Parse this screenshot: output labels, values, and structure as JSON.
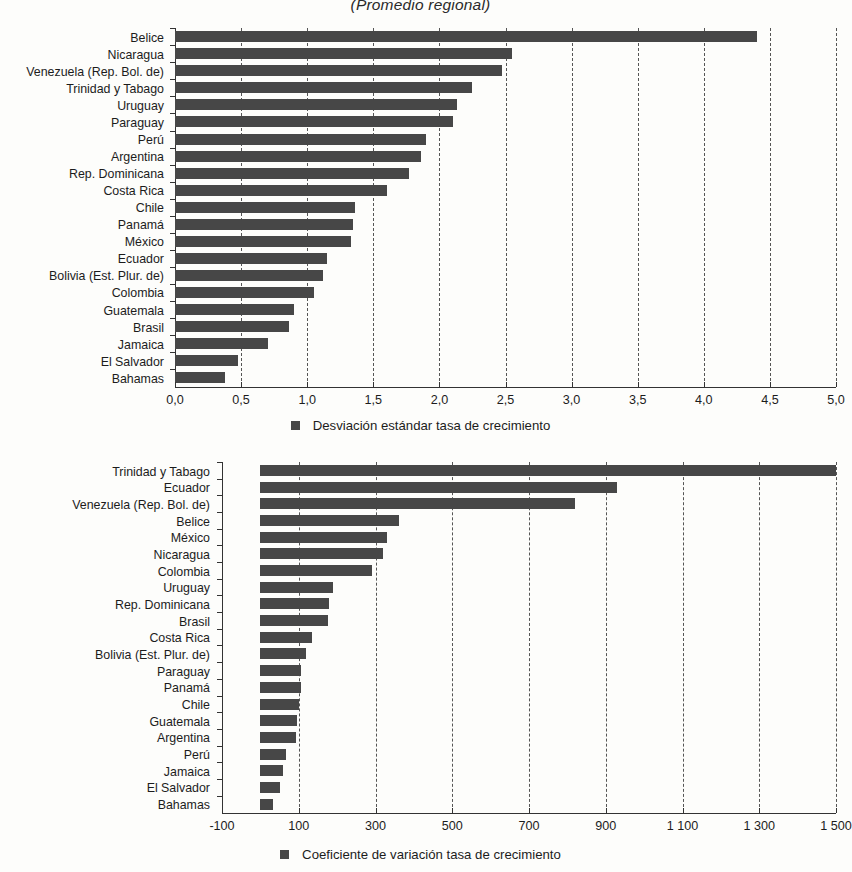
{
  "title": "(Promedio regional)",
  "colors": {
    "bar": "#474747",
    "axis": "#333333",
    "text": "#1c1c1c"
  },
  "charts": [
    {
      "legend_label": "Desviación estándar tasa de crecimiento",
      "legend_icon": "square-marker-icon"
    },
    {
      "legend_label": "Coeficiente de variación tasa de crecimiento",
      "legend_icon": "square-marker-icon"
    }
  ],
  "chart_data": [
    {
      "type": "bar",
      "orientation": "horizontal",
      "title": "(Promedio regional)",
      "xlabel": "",
      "ylabel": "",
      "xlim": [
        0,
        5
      ],
      "xticks": [
        0,
        0.5,
        1,
        1.5,
        2,
        2.5,
        3,
        3.5,
        4,
        4.5,
        5
      ],
      "xticklabels": [
        "0,0",
        "0,5",
        "1,0",
        "1,5",
        "2,0",
        "2,5",
        "3,0",
        "3,5",
        "4,0",
        "4,5",
        "5,0"
      ],
      "grid": true,
      "legend": [
        "Desviación estándar tasa de crecimiento"
      ],
      "legend_position": "bottom",
      "categories": [
        "Belice",
        "Nicaragua",
        "Venezuela (Rep. Bol. de)",
        "Trinidad y Tabago",
        "Uruguay",
        "Paraguay",
        "Perú",
        "Argentina",
        "Rep. Dominicana",
        "Costa Rica",
        "Chile",
        "Panamá",
        "México",
        "Ecuador",
        "Bolivia (Est. Plur. de)",
        "Colombia",
        "Guatemala",
        "Brasil",
        "Jamaica",
        "El Salvador",
        "Bahamas"
      ],
      "values": [
        4.4,
        2.55,
        2.47,
        2.25,
        2.13,
        2.1,
        1.9,
        1.86,
        1.77,
        1.6,
        1.36,
        1.35,
        1.33,
        1.15,
        1.12,
        1.05,
        0.9,
        0.86,
        0.7,
        0.48,
        0.38
      ]
    },
    {
      "type": "bar",
      "orientation": "horizontal",
      "title": "",
      "xlabel": "",
      "ylabel": "",
      "xlim": [
        -100,
        1500
      ],
      "xticks": [
        -100,
        100,
        300,
        500,
        700,
        900,
        1100,
        1300,
        1500
      ],
      "xticklabels": [
        "-100",
        "100",
        "300",
        "500",
        "700",
        "900",
        "1 100",
        "1 300",
        "1 500"
      ],
      "grid": true,
      "legend": [
        "Coeficiente de variación tasa de crecimiento"
      ],
      "legend_position": "bottom",
      "categories": [
        "Trinidad y Tabago",
        "Ecuador",
        "Venezuela (Rep. Bol. de)",
        "Belice",
        "México",
        "Nicaragua",
        "Colombia",
        "Uruguay",
        "Rep. Dominicana",
        "Brasil",
        "Costa Rica",
        "Bolivia (Est. Plur. de)",
        "Paraguay",
        "Panamá",
        "Chile",
        "Guatemala",
        "Argentina",
        "Perú",
        "Jamaica",
        "El Salvador",
        "Bahamas"
      ],
      "values": [
        1500,
        930,
        820,
        360,
        330,
        320,
        290,
        190,
        180,
        175,
        135,
        120,
        105,
        105,
        100,
        95,
        93,
        68,
        60,
        50,
        32
      ]
    }
  ]
}
